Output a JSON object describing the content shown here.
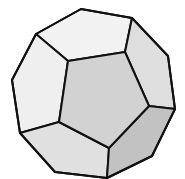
{
  "figure": {
    "colors": {
      "front_face": "#d2d2d2",
      "upper_face": "#f2f2f2",
      "upper_left_face": "#efefef",
      "upper_right_face": "#dedede",
      "lower_left_face": "#e0e0e0",
      "lower_right_face": "#c2c2c2",
      "edge": "#111111",
      "background": "#ffffff"
    }
  }
}
